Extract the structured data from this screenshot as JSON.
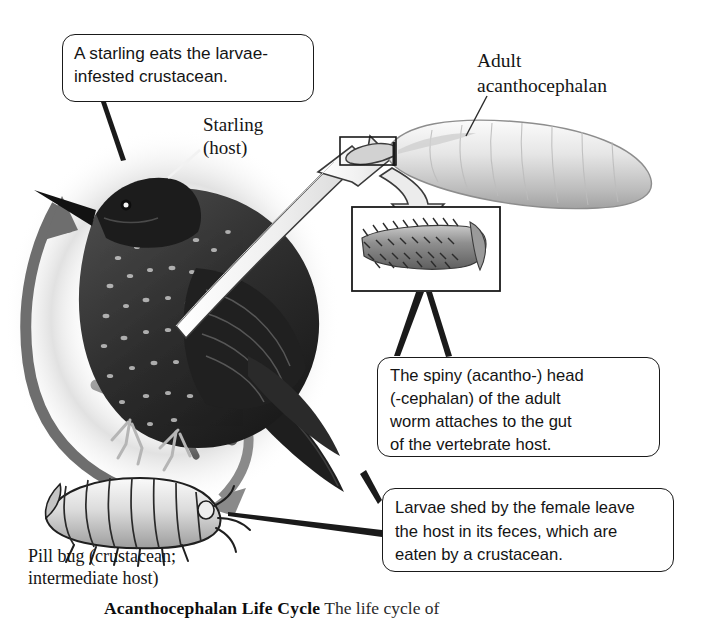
{
  "figure": {
    "title": "Acanthocephalan Life Cycle",
    "medium": "grayscale scientific illustration"
  },
  "callouts": [
    {
      "id": "eats",
      "name": "callout-starling-eats",
      "text": "A starling eats the larvae-\ninfested crustacean."
    },
    {
      "id": "spiny",
      "name": "callout-spiny-head",
      "text": "The spiny (acantho-) head\n(-cephalan) of the adult\nworm attaches to the gut\nof the vertebrate host."
    },
    {
      "id": "larvae",
      "name": "callout-larvae-shed",
      "text": "Larvae shed by the female leave\nthe host in its feces, which are\neaten by a crustacean."
    }
  ],
  "labels": {
    "starling": "Starling\n(host)",
    "adult_worm": "Adult\nacanthocephalan",
    "pill_bug": "Pill bug (crustacean;\nintermediate host)"
  },
  "caption": {
    "bold": "Acanthocephalan Life Cycle",
    "normal": "  The life cycle of"
  },
  "organisms": {
    "starling": "european-starling-perched-on-branch",
    "pill_bug": "pill-bug-isopod",
    "adult_worm": "adult-acanthocephalan-worm",
    "proboscis_inset": "magnified-spiny-proboscis"
  },
  "arrows": {
    "pillbug_to_starling": "ingestion-arrow-upward-left",
    "starling_to_pillbug": "feces-arrow-downward-right",
    "starling_to_worm": "white-arrow-bird-to-adult-worm",
    "worm_to_inset": "magnify-arrow-to-proboscis-inset"
  },
  "colors": {
    "ink": "#1a1a1a",
    "dark_arrow": "#6e6e6e",
    "white_arrow_fill": "#f2f2f2",
    "vignette": "#b9b9b9",
    "bird_dark": "#2b2b2b",
    "bug_gray": "#d9d9d9"
  }
}
